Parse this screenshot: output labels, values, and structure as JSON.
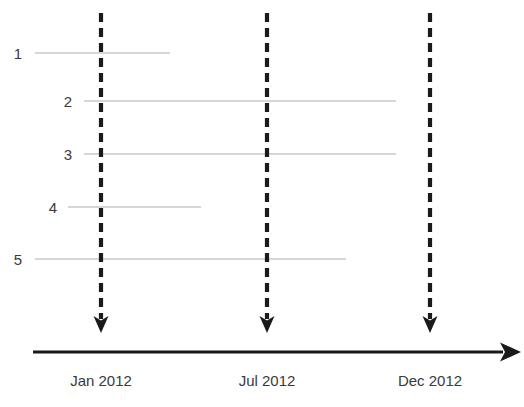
{
  "diagram": {
    "type": "timeline",
    "background_color": "#ffffff",
    "span_line_color": "#c8c8c8",
    "marker_color": "#1a1a1a",
    "axis_color": "#1a1a1a",
    "text_color": "#3a3a3a",
    "rows": [
      {
        "label": "1",
        "label_x": 22,
        "y": 53,
        "x_start": 35,
        "x_end": 170
      },
      {
        "label": "2",
        "label_x": 72,
        "y": 101,
        "x_start": 84,
        "x_end": 396
      },
      {
        "label": "3",
        "label_x": 72,
        "y": 154,
        "x_start": 84,
        "x_end": 396
      },
      {
        "label": "4",
        "label_x": 57,
        "y": 207,
        "x_start": 68,
        "x_end": 201
      },
      {
        "label": "5",
        "label_x": 22,
        "y": 259,
        "x_start": 35,
        "x_end": 346
      }
    ],
    "markers": [
      {
        "label": "Jan 2012",
        "x": 101,
        "y_top": 13,
        "y_tip": 333,
        "label_y": 373
      },
      {
        "label": "Jul 2012",
        "x": 267,
        "y_top": 13,
        "y_tip": 333,
        "label_y": 373
      },
      {
        "label": "Dec 2012",
        "x": 430,
        "y_top": 13,
        "y_tip": 333,
        "label_y": 373
      }
    ],
    "axis": {
      "y": 352,
      "x_start": 33,
      "x_end": 521
    }
  }
}
